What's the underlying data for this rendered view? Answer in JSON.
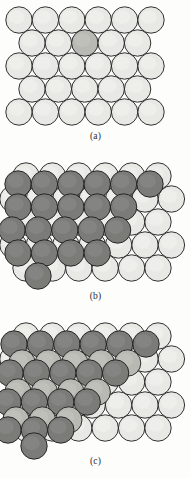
{
  "figure": {
    "background": "#fdfdfc",
    "width": 191,
    "height": 478
  },
  "colors": {
    "light": "#e8e8e4",
    "light_highlight": "#f2f2ee",
    "medium": "#b9b9b4",
    "dark": "#7b7b78",
    "dark_highlight": "#8d8d8a",
    "outline": "#1c1c1c",
    "caption_text": "#2b2b2b"
  },
  "panels": [
    {
      "id": "a",
      "caption": "(a)",
      "description": "flat terrace of close-packed light spheres with one adatom-shaded sphere",
      "top": 2,
      "height": 128,
      "caption_top": 131,
      "radius": 13.2,
      "rows": [
        {
          "y": 18,
          "x_start": 19,
          "count": 6,
          "spacing": 26.4,
          "shades": [
            "light",
            "light",
            "light",
            "light",
            "light",
            "light"
          ]
        },
        {
          "y": 41,
          "x_start": 32,
          "count": 5,
          "spacing": 26.4,
          "shades": [
            "light",
            "light",
            "medium",
            "light",
            "light"
          ]
        },
        {
          "y": 64,
          "x_start": 19,
          "count": 6,
          "spacing": 26.4,
          "shades": [
            "light",
            "light",
            "light",
            "light",
            "light",
            "light"
          ]
        },
        {
          "y": 87,
          "x_start": 32,
          "count": 5,
          "spacing": 26.4,
          "shades": [
            "light",
            "light",
            "light",
            "light",
            "light"
          ]
        },
        {
          "y": 110,
          "x_start": 19,
          "count": 6,
          "spacing": 26.4,
          "shades": [
            "light",
            "light",
            "light",
            "light",
            "light",
            "light"
          ]
        }
      ]
    },
    {
      "id": "b",
      "caption": "(b)",
      "description": "island of dark spheres forming a single-height step on a light terrace",
      "top": 160,
      "height": 128,
      "caption_top": 291,
      "radius": 13.2,
      "base_rows": [
        {
          "y": 16,
          "x_start": 26,
          "count": 6,
          "spacing": 26.4,
          "shades": [
            "light",
            "light",
            "light",
            "light",
            "light",
            "light"
          ]
        },
        {
          "y": 39,
          "x_start": 13,
          "count": 7,
          "spacing": 26.4,
          "shades": [
            "light",
            "light",
            "light",
            "light",
            "light",
            "light",
            "light"
          ]
        },
        {
          "y": 62,
          "x_start": 26,
          "count": 6,
          "spacing": 26.4,
          "shades": [
            "light",
            "light",
            "light",
            "light",
            "light",
            "light"
          ]
        },
        {
          "y": 85,
          "x_start": 13,
          "count": 7,
          "spacing": 26.4,
          "shades": [
            "light",
            "light",
            "light",
            "light",
            "light",
            "light",
            "light"
          ]
        },
        {
          "y": 108,
          "x_start": 26,
          "count": 6,
          "spacing": 26.4,
          "shades": [
            "light",
            "light",
            "light",
            "light",
            "light",
            "light"
          ]
        }
      ],
      "overlayer_rows": [
        {
          "y": 24,
          "x_start": 18,
          "count": 6,
          "spacing": 26.4,
          "shade": "dark"
        },
        {
          "y": 47,
          "x_start": 18,
          "count": 5,
          "spacing": 26.4,
          "shade": "dark"
        },
        {
          "y": 70,
          "x_start": 12,
          "count": 5,
          "spacing": 26.4,
          "shade": "dark"
        },
        {
          "y": 93,
          "x_start": 18,
          "count": 4,
          "spacing": 26.4,
          "shade": "dark"
        },
        {
          "y": 116,
          "x_start": 38,
          "count": 1,
          "spacing": 26.4,
          "shade": "dark"
        }
      ]
    },
    {
      "id": "c",
      "caption": "(c)",
      "description": "multi-level terraced stack of dark spheres stepping down onto a light terrace",
      "top": 320,
      "height": 135,
      "caption_top": 456,
      "radius": 13.2,
      "base_rows": [
        {
          "y": 16,
          "x_start": 26,
          "count": 6,
          "spacing": 26.4,
          "shades": [
            "light",
            "light",
            "light",
            "light",
            "light",
            "light"
          ]
        },
        {
          "y": 39,
          "x_start": 13,
          "count": 7,
          "spacing": 26.4,
          "shades": [
            "light",
            "light",
            "light",
            "light",
            "light",
            "light",
            "light"
          ]
        },
        {
          "y": 62,
          "x_start": 26,
          "count": 6,
          "spacing": 26.4,
          "shades": [
            "light",
            "light",
            "light",
            "light",
            "light",
            "light"
          ]
        },
        {
          "y": 85,
          "x_start": 13,
          "count": 7,
          "spacing": 26.4,
          "shades": [
            "light",
            "light",
            "light",
            "light",
            "light",
            "light",
            "light"
          ]
        },
        {
          "y": 108,
          "x_start": 26,
          "count": 6,
          "spacing": 26.4,
          "shades": [
            "light",
            "light",
            "light",
            "light",
            "light",
            "light"
          ]
        }
      ],
      "terrace_levels": [
        {
          "y": 24,
          "x_start": 14,
          "count": 6,
          "spacing": 26.4,
          "shade": "dark"
        },
        {
          "y": 43,
          "x_start": 22,
          "count": 5,
          "spacing": 26.4,
          "shade": "medium"
        },
        {
          "y": 53,
          "x_start": 10,
          "count": 5,
          "spacing": 26.4,
          "shade": "dark"
        },
        {
          "y": 72,
          "x_start": 18,
          "count": 4,
          "spacing": 26.4,
          "shade": "medium"
        },
        {
          "y": 82,
          "x_start": 8,
          "count": 4,
          "spacing": 26.4,
          "shade": "dark"
        },
        {
          "y": 100,
          "x_start": 16,
          "count": 3,
          "spacing": 26.4,
          "shade": "medium"
        },
        {
          "y": 110,
          "x_start": 8,
          "count": 3,
          "spacing": 26.4,
          "shade": "dark"
        },
        {
          "y": 126,
          "x_start": 34,
          "count": 1,
          "spacing": 26.4,
          "shade": "dark"
        }
      ]
    }
  ]
}
